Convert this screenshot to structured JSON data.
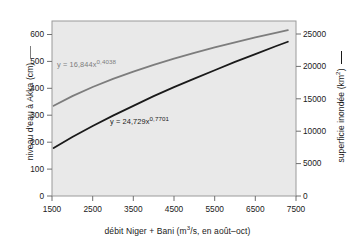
{
  "chart_data": {
    "type": "line",
    "title": "",
    "xlabel": "débit Niger + Bani (m³/s, en août–oct)",
    "xlabel_parts": {
      "pre": "débit Niger + Bani (m",
      "sup": "3",
      "post": "/s, en août–oct)"
    },
    "xlim": [
      1500,
      7500
    ],
    "xticks": [
      "1500",
      "2500",
      "3500",
      "4500",
      "5500",
      "6500",
      "7500"
    ],
    "xtick_values": [
      1500,
      2500,
      3500,
      4500,
      5500,
      6500,
      7500
    ],
    "grid": false,
    "legend_position": "axis-labels",
    "left_axis": {
      "label": "niveau d'eau à Akka (cm)",
      "ylim": [
        0,
        650
      ],
      "yticks": [
        "0",
        "100",
        "200",
        "300",
        "400",
        "500",
        "600"
      ],
      "ytick_values": [
        0,
        100,
        200,
        300,
        400,
        500,
        600
      ],
      "color": "#7d7d7d"
    },
    "right_axis": {
      "label_parts": {
        "pre": "superficie inondée (km",
        "sup": "2",
        "post": ")"
      },
      "label": "superficie inondée (km²)",
      "ylim": [
        0,
        27000
      ],
      "yticks": [
        "0",
        "5000",
        "10000",
        "15000",
        "20000",
        "25000"
      ],
      "ytick_values": [
        0,
        5000,
        10000,
        15000,
        20000,
        25000
      ],
      "color": "#1a1a1a"
    },
    "series": [
      {
        "name": "niveau d'eau à Akka (cm)",
        "axis": "left",
        "color": "#7d7d7d",
        "equation_parts": {
          "pre": "y = 16,844x",
          "sup": "0,4038"
        },
        "equation": "y = 16,844x^0,4038",
        "coefficient": 16.844,
        "exponent": 0.4038,
        "x": [
          1540,
          2000,
          2500,
          3000,
          3500,
          4000,
          4500,
          5000,
          5500,
          6000,
          6500,
          7000,
          7300
        ],
        "values": [
          335,
          371,
          405,
          435,
          462,
          487,
          510,
          532,
          552,
          571,
          589,
          606,
          616
        ]
      },
      {
        "name": "superficie inondée (km²)",
        "axis": "right",
        "color": "#1a1a1a",
        "equation_parts": {
          "pre": "y = 24,729x",
          "sup": "0,7701"
        },
        "equation": "y = 24,729x^0,7701",
        "coefficient": 24.729,
        "exponent": 0.7701,
        "x": [
          1540,
          2000,
          2500,
          3000,
          3500,
          4000,
          4500,
          5000,
          5500,
          6000,
          6500,
          7000,
          7300
        ],
        "values": [
          7400,
          9100,
          10800,
          12400,
          13900,
          15400,
          16800,
          18100,
          19400,
          20700,
          21900,
          23100,
          23800
        ]
      }
    ]
  },
  "plot": {
    "background_color": "#e9e9e9",
    "border_color": "#9a9a9a"
  }
}
